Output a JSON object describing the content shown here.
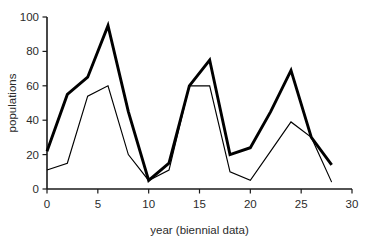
{
  "chart_data": {
    "type": "line",
    "title": "",
    "xlabel": "year (biennial data)",
    "ylabel": "populations",
    "xlim": [
      0,
      30
    ],
    "ylim": [
      0,
      100
    ],
    "xticks": [
      0,
      5,
      10,
      15,
      20,
      25,
      30
    ],
    "yticks": [
      0,
      20,
      40,
      60,
      80,
      100
    ],
    "xticklabels": [
      "0",
      "5",
      "10",
      "15",
      "20",
      "25",
      "30"
    ],
    "yticklabels": [
      "0",
      "20",
      "40",
      "60",
      "80",
      "100"
    ],
    "grid": false,
    "legend": "none",
    "x": [
      0,
      2,
      4,
      6,
      8,
      10,
      12,
      14,
      16,
      18,
      20,
      22,
      24,
      26,
      28
    ],
    "series": [
      {
        "name": "thick-line",
        "line_width": "thick",
        "color": "#000000",
        "values": [
          22,
          55,
          65,
          95,
          45,
          5,
          15,
          60,
          75,
          20,
          24,
          45,
          69,
          30,
          14
        ]
      },
      {
        "name": "thin-line",
        "line_width": "thin",
        "color": "#000000",
        "values": [
          11,
          15,
          54,
          60,
          20,
          5,
          11,
          60,
          60,
          10,
          5,
          22,
          39,
          30,
          4
        ]
      }
    ]
  },
  "axes": {
    "x_title": "year (biennial data)",
    "y_title": "populations"
  }
}
